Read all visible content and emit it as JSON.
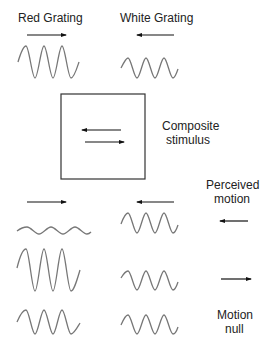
{
  "labels": {
    "red_grating": "Red Grating",
    "white_grating": "White Grating",
    "composite_line1": "Composite",
    "composite_line2": "stimulus",
    "perceived_line1": "Perceived",
    "perceived_line2": "motion",
    "null_line1": "Motion",
    "null_line2": "null"
  },
  "colors": {
    "wave": "#777777",
    "arrow": "#111111",
    "box": "#333333"
  },
  "rows": [
    {
      "name": "top",
      "red_amplitude": "large",
      "white_amplitude": "medium",
      "red_direction": "right",
      "white_direction": "left"
    },
    {
      "name": "row1",
      "red_amplitude": "small",
      "white_amplitude": "large",
      "perceived": "left"
    },
    {
      "name": "row2",
      "red_amplitude": "large",
      "white_amplitude": "small",
      "perceived": "right"
    },
    {
      "name": "row3",
      "red_amplitude": "medium",
      "white_amplitude": "medium",
      "perceived": "null"
    }
  ]
}
